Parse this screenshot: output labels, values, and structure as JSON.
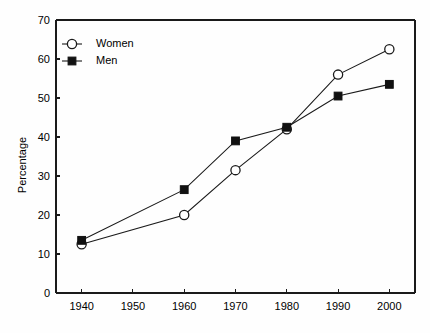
{
  "chart_data": {
    "type": "line",
    "title": "",
    "xlabel": "",
    "ylabel": "Percentage",
    "x": [
      1940,
      1950,
      1960,
      1970,
      1980,
      1990,
      2000
    ],
    "xtick_labels": [
      "1940",
      "1950",
      "1960",
      "1970",
      "1980",
      "1990",
      "2000"
    ],
    "ytick_labels": [
      "0",
      "10",
      "20",
      "30",
      "40",
      "50",
      "60",
      "70"
    ],
    "yticks": [
      0,
      10,
      20,
      30,
      40,
      50,
      60,
      70
    ],
    "xlim": [
      1935,
      2005
    ],
    "ylim": [
      0,
      70
    ],
    "grid": false,
    "legend_position": "top-left",
    "series": [
      {
        "name": "Women",
        "marker": "open-circle",
        "color": "#1a1a1a",
        "points": [
          {
            "x": 1940,
            "y": 12.5
          },
          {
            "x": 1960,
            "y": 20.0
          },
          {
            "x": 1970,
            "y": 31.5
          },
          {
            "x": 1980,
            "y": 42.0
          },
          {
            "x": 1990,
            "y": 56.0
          },
          {
            "x": 2000,
            "y": 62.5
          }
        ]
      },
      {
        "name": "Men",
        "marker": "filled-square",
        "color": "#111111",
        "points": [
          {
            "x": 1940,
            "y": 13.5
          },
          {
            "x": 1960,
            "y": 26.5
          },
          {
            "x": 1970,
            "y": 39.0
          },
          {
            "x": 1980,
            "y": 42.5
          },
          {
            "x": 1990,
            "y": 50.5
          },
          {
            "x": 2000,
            "y": 53.5
          }
        ]
      }
    ],
    "legend": [
      {
        "label": "Women",
        "marker": "open-circle"
      },
      {
        "label": "Men",
        "marker": "filled-square"
      }
    ],
    "colors": {
      "background": "#fefefe",
      "axis": "#1a1a1a",
      "text": "#000000",
      "marker_fill_open": "#ffffff",
      "marker_fill_solid": "#111111"
    }
  }
}
